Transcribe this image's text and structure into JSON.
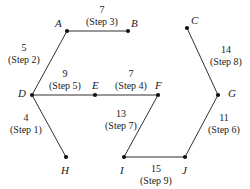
{
  "diagram": {
    "type": "graph",
    "colors": {
      "background": "#ffffff",
      "edge": "#1a1a1a",
      "node": "#111111",
      "text": "#1a1a1a"
    },
    "nodes": [
      {
        "id": "A",
        "label": "A",
        "x": 67,
        "y": 31,
        "label_x": 55,
        "label_y": 18
      },
      {
        "id": "B",
        "label": "B",
        "x": 128,
        "y": 31,
        "label_x": 131,
        "label_y": 18
      },
      {
        "id": "C",
        "label": "C",
        "x": 187,
        "y": 28,
        "label_x": 191,
        "label_y": 15
      },
      {
        "id": "D",
        "label": "D",
        "x": 32,
        "y": 95,
        "label_x": 18,
        "label_y": 88
      },
      {
        "id": "E",
        "label": "E",
        "x": 95,
        "y": 95,
        "label_x": 92,
        "label_y": 80
      },
      {
        "id": "F",
        "label": "F",
        "x": 158,
        "y": 95,
        "label_x": 155,
        "label_y": 80
      },
      {
        "id": "G",
        "label": "G",
        "x": 218,
        "y": 95,
        "label_x": 228,
        "label_y": 88
      },
      {
        "id": "H",
        "label": "H",
        "x": 66,
        "y": 157,
        "label_x": 61,
        "label_y": 165
      },
      {
        "id": "I",
        "label": "I",
        "x": 124,
        "y": 157,
        "label_x": 120,
        "label_y": 165
      },
      {
        "id": "J",
        "label": "J",
        "x": 185,
        "y": 157,
        "label_x": 182,
        "label_y": 165
      }
    ],
    "edges": [
      {
        "id": "A-B",
        "from": "A",
        "to": "B",
        "weight": "7",
        "step": "(Step 3)",
        "label_x": 74,
        "label_y": 4,
        "label_w": 56
      },
      {
        "id": "A-D",
        "from": "A",
        "to": "D",
        "weight": "5",
        "step": "(Step 2)",
        "label_x": 0,
        "label_y": 42,
        "label_w": 48
      },
      {
        "id": "D-E",
        "from": "D",
        "to": "E",
        "weight": "9",
        "step": "(Step 5)",
        "label_x": 40,
        "label_y": 68,
        "label_w": 50
      },
      {
        "id": "E-F",
        "from": "E",
        "to": "F",
        "weight": "7",
        "step": "(Step 4)",
        "label_x": 106,
        "label_y": 68,
        "label_w": 50
      },
      {
        "id": "D-H",
        "from": "D",
        "to": "H",
        "weight": "4",
        "step": "(Step 1)",
        "label_x": 2,
        "label_y": 112,
        "label_w": 48
      },
      {
        "id": "F-I",
        "from": "F",
        "to": "I",
        "weight": "13",
        "step": "(Step 7)",
        "label_x": 97,
        "label_y": 108,
        "label_w": 48
      },
      {
        "id": "I-J",
        "from": "I",
        "to": "J",
        "weight": "15",
        "step": "(Step 9)",
        "label_x": 131,
        "label_y": 163,
        "label_w": 50
      },
      {
        "id": "C-G",
        "from": "C",
        "to": "G",
        "weight": "14",
        "step": "(Step 8)",
        "label_x": 202,
        "label_y": 44,
        "label_w": 48
      },
      {
        "id": "G-J",
        "from": "G",
        "to": "J",
        "weight": "11",
        "step": "(Step 6)",
        "label_x": 200,
        "label_y": 112,
        "label_w": 48
      }
    ]
  }
}
